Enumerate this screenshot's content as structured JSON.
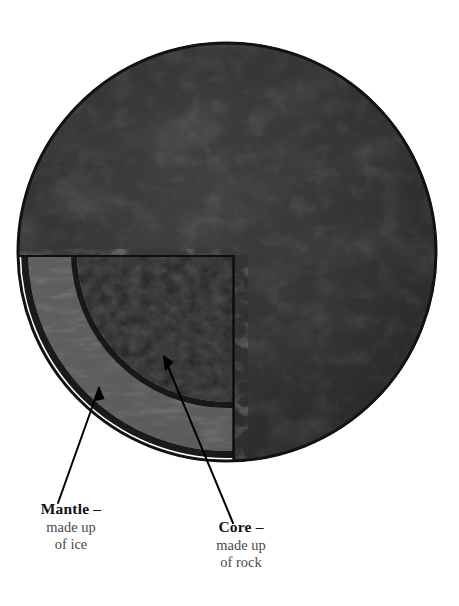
{
  "figure": {
    "type": "planet-cutaway-diagram",
    "background_color": "#ffffff"
  },
  "planet": {
    "name": "planet-body",
    "center": {
      "x": 227,
      "y": 252
    },
    "radius": 210,
    "surface_color": "#2f2f2f",
    "surface_color_dark": "#1f1f1f",
    "surface_color_light": "#434343",
    "crust_rim_color": "#151515"
  },
  "cutaway": {
    "name": "cutaway-wedge",
    "description": "quarter wedge removed from lower-left of the sphere",
    "top_edge_y": 255,
    "right_edge_x": 233,
    "layers": [
      {
        "id": "mantle",
        "label": "Mantle",
        "composition": "ice",
        "color": "#5e5e5e",
        "inner_radius": 150,
        "outer_radius": 200
      },
      {
        "id": "core",
        "label": "Core",
        "composition": "rock",
        "color": "#1c1c1c",
        "radius": 150
      }
    ]
  },
  "annotations": [
    {
      "id": "mantle-annotation",
      "head": "Mantle –",
      "line2": "made up",
      "line3": "of ice",
      "arrow": {
        "tail_x": 58,
        "tail_y": 502,
        "tip_x": 99,
        "tip_y": 386
      },
      "arrow_color": "#000000"
    },
    {
      "id": "core-annotation",
      "head": "Core –",
      "line2": "made up",
      "line3": "of rock",
      "arrow": {
        "tail_x": 232,
        "tail_y": 522,
        "tip_x": 163,
        "tip_y": 355
      },
      "arrow_color": "#000000"
    }
  ],
  "labels": {
    "mantle": {
      "head": "Mantle –",
      "line2": "made up",
      "line3": "of ice"
    },
    "core": {
      "head": "Core –",
      "line2": "made up",
      "line3": "of rock"
    }
  }
}
